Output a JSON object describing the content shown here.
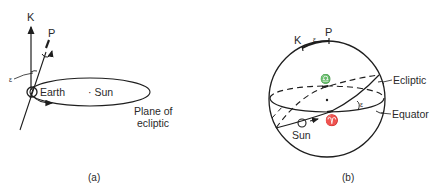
{
  "figure_a": {
    "caption": "(a)",
    "labels": {
      "k": "K",
      "p": "P",
      "epsilon": "ε",
      "earth": "Earth",
      "sun": "· Sun",
      "plane_line1": "Plane of",
      "plane_line2": "ecliptic"
    }
  },
  "figure_b": {
    "caption": "(b)",
    "labels": {
      "k": "K",
      "p": "P",
      "epsilon_top": "ε",
      "epsilon_angle": "ε",
      "libra": "♎",
      "aries": "♈",
      "ecliptic": "Ecliptic",
      "equator": "Equator",
      "sun": "Sun"
    }
  }
}
